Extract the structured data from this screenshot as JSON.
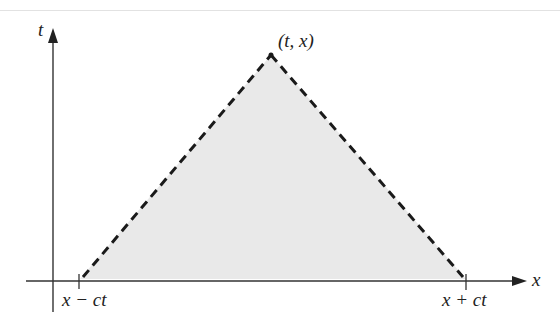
{
  "diagram": {
    "type": "domain-of-dependence",
    "axes": {
      "vertical_label": "t",
      "horizontal_label": "x"
    },
    "apex_label": "(t, x)",
    "base_left_label": "x − ct",
    "base_right_label": "x + ct",
    "colors": {
      "fill": "#e8e8e8",
      "stroke": "#1a1a1a",
      "axis": "#333333"
    }
  }
}
